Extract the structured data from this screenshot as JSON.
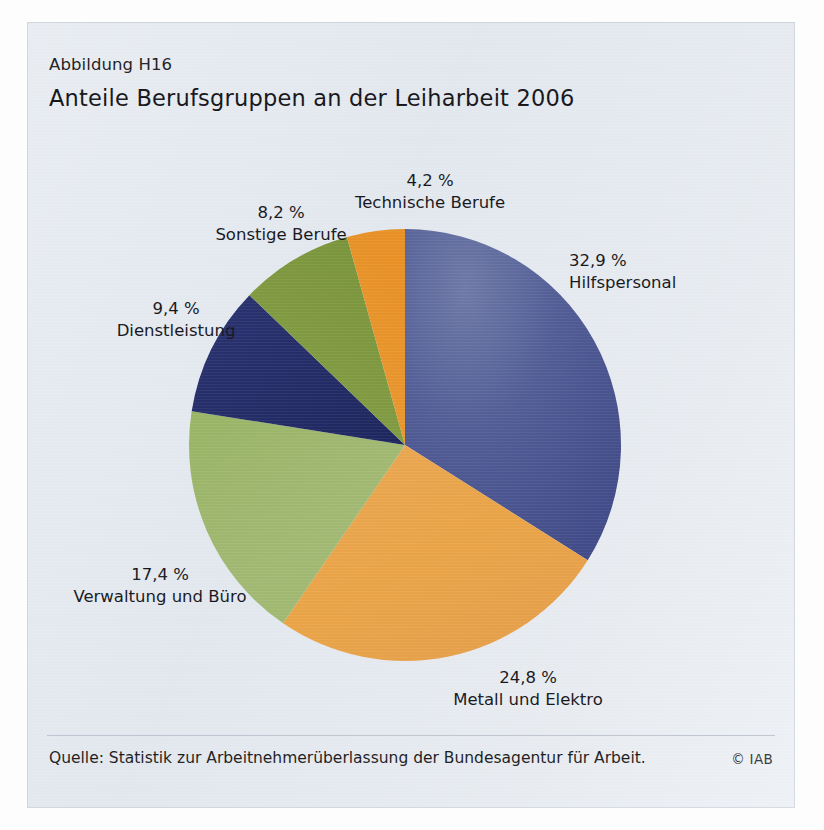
{
  "figure_number": "Abbildung H16",
  "title": "Anteile Berufsgruppen an der Leiharbeit 2006",
  "source": "Quelle: Statistik zur Arbeitnehmerüberlassung der Bundesagentur für Arbeit.",
  "copyright": "© IAB",
  "chart_data": {
    "type": "pie",
    "title": "Anteile Berufsgruppen an der Leiharbeit 2006",
    "xlabel": "",
    "ylabel": "",
    "unit": "%",
    "decimal_separator": ",",
    "legend": "labels placed outside slices",
    "grid": false,
    "categories": [
      "Hilfspersonal",
      "Metall und Elektro",
      "Verwaltung und Büro",
      "Dienstleistung",
      "Sonstige Berufe",
      "Technische Berufe"
    ],
    "values": [
      32.9,
      24.8,
      17.4,
      9.4,
      8.2,
      4.2
    ],
    "labels": [
      {
        "pct": "32,9 %",
        "name": "Hilfspersonal",
        "value": 32.9,
        "color": "#4b5691"
      },
      {
        "pct": "24,8 %",
        "name": "Metall und Elektro",
        "value": 24.8,
        "color": "#eaa44c"
      },
      {
        "pct": "17,4 %",
        "name": "Verwaltung und Büro",
        "value": 17.4,
        "color": "#9db76c"
      },
      {
        "pct": "9,4 %",
        "name": "Dienstleistung",
        "value": 9.4,
        "color": "#232b67"
      },
      {
        "pct": "8,2 %",
        "name": "Sonstige Berufe",
        "value": 8.2,
        "color": "#819b41"
      },
      {
        "pct": "4,2 %",
        "name": "Technische Berufe",
        "value": 4.2,
        "color": "#e8962b"
      }
    ],
    "colors": [
      "#4b5691",
      "#eaa44c",
      "#9db76c",
      "#232b67",
      "#819b41",
      "#e8962b"
    ],
    "start_angle_deg": 0,
    "direction": "clockwise",
    "panel_color": "#e6eaf0"
  }
}
